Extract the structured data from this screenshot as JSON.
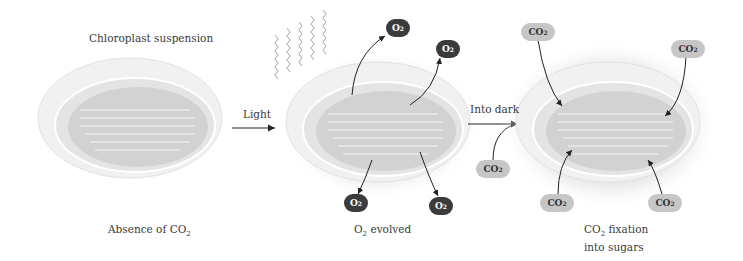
{
  "figure": {
    "panels": [
      {
        "id": "panel-1",
        "top_label": "Chloroplast suspension",
        "bottom_label_main": "Absence of CO",
        "bottom_label_sub": "2",
        "bottom_label_rest": ""
      },
      {
        "id": "panel-2",
        "bottom_label_main": "O",
        "bottom_label_sub": "2",
        "bottom_label_rest": " evolved"
      },
      {
        "id": "panel-3",
        "bottom_label_main": "CO",
        "bottom_label_sub": "2",
        "bottom_label_rest": " fixation",
        "bottom_label_line2": "into sugars"
      }
    ],
    "transitions": [
      {
        "label": "Light"
      },
      {
        "label": "Into dark"
      }
    ],
    "molecules": {
      "o2": {
        "main": "O",
        "sub": "2",
        "color": "#3b3b3b",
        "count": 4
      },
      "co2": {
        "main": "CO",
        "sub": "2",
        "color": "#c6c6c6",
        "count": 5
      }
    }
  }
}
